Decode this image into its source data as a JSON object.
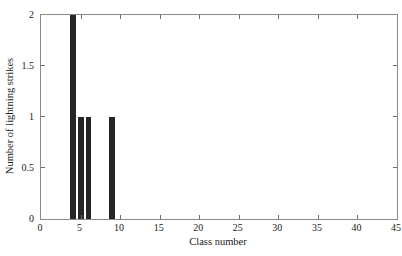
{
  "chart_data": {
    "type": "bar",
    "title": "",
    "xlabel": "Class number",
    "ylabel": "Number of lightning strikes",
    "xlim": [
      0,
      45
    ],
    "ylim": [
      0,
      2
    ],
    "xticks": [
      0,
      5,
      10,
      15,
      20,
      25,
      30,
      35,
      40,
      45
    ],
    "xticklabels": [
      "0",
      "5",
      "10",
      "15",
      "20",
      "25",
      "30",
      "35",
      "40",
      "45"
    ],
    "yticks": [
      0,
      0.5,
      1,
      1.5,
      2
    ],
    "yticklabels": [
      "0",
      "0.5",
      "1",
      "1.5",
      "2"
    ],
    "grid": false,
    "legend": null,
    "bar_color": "#262626",
    "axis_color": "#8a8a8a",
    "bar_width": 0.75,
    "categories": [
      4,
      5,
      6,
      9
    ],
    "values": [
      2,
      1,
      1,
      1
    ],
    "bars": [
      {
        "x": 4,
        "value": 2
      },
      {
        "x": 5,
        "value": 1
      },
      {
        "x": 6,
        "value": 1
      },
      {
        "x": 9,
        "value": 1
      }
    ]
  }
}
